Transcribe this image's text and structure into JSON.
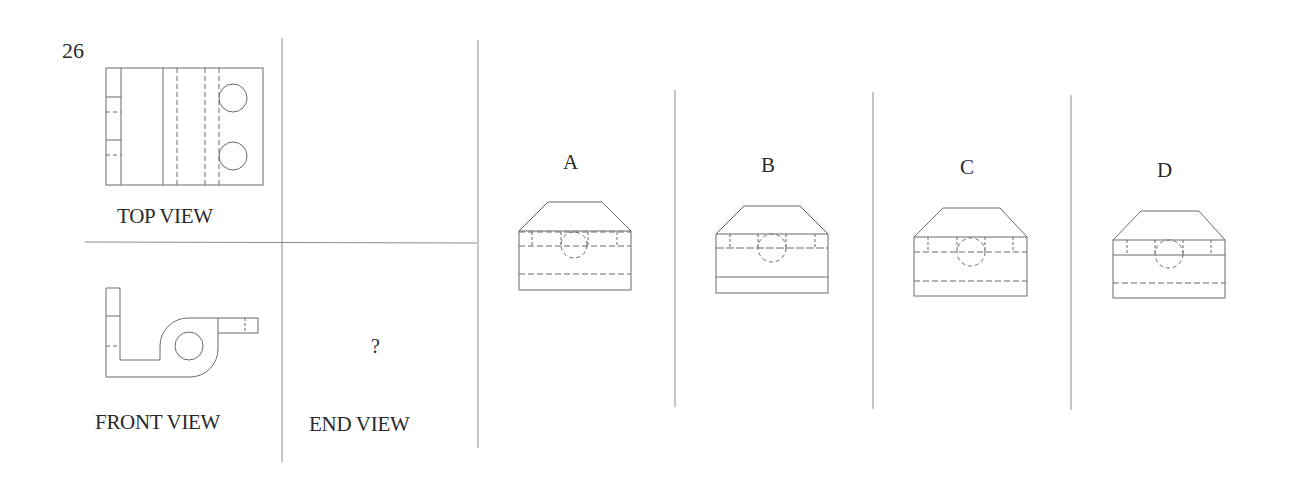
{
  "question": {
    "number": "26",
    "views": {
      "top_label": "TOP VIEW",
      "front_label": "FRONT VIEW",
      "end_label": "END VIEW",
      "end_placeholder": "?"
    },
    "options": [
      {
        "label": "A"
      },
      {
        "label": "B"
      },
      {
        "label": "C"
      },
      {
        "label": "D"
      }
    ]
  },
  "colors": {
    "line": "#6a6a6a",
    "frame": "#8a8a8a",
    "text": "#2a2a2a",
    "background": "#ffffff"
  }
}
